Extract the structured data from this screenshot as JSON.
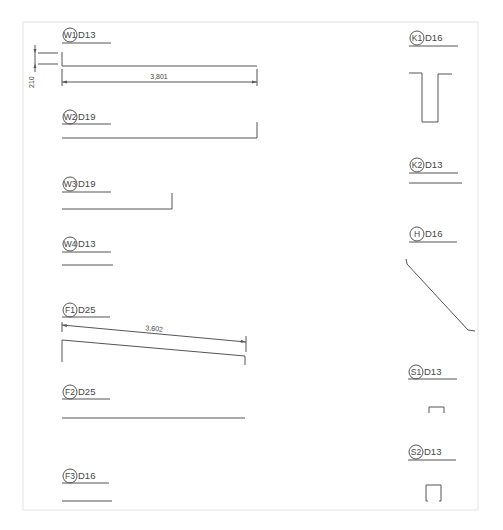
{
  "drawing": {
    "type": "rebar bending schedule",
    "colors": {
      "line": "#555555",
      "text": "#444444",
      "frame": "#e4e4e4",
      "background": "#ffffff"
    }
  },
  "bars": [
    {
      "id": "W1",
      "dia": "D13"
    },
    {
      "id": "W2",
      "dia": "D19"
    },
    {
      "id": "W3",
      "dia": "D19"
    },
    {
      "id": "W4",
      "dia": "D13"
    },
    {
      "id": "F1",
      "dia": "D25"
    },
    {
      "id": "F2",
      "dia": "D25"
    },
    {
      "id": "F3",
      "dia": "D16"
    },
    {
      "id": "K1",
      "dia": "D16"
    },
    {
      "id": "K2",
      "dia": "D13"
    },
    {
      "id": "H",
      "dia": "D16"
    },
    {
      "id": "S1",
      "dia": "D13"
    },
    {
      "id": "S2",
      "dia": "D13"
    }
  ],
  "dimensions": {
    "w1_hook": "210",
    "w1_length": "3,801",
    "f1_length": "3,602"
  }
}
